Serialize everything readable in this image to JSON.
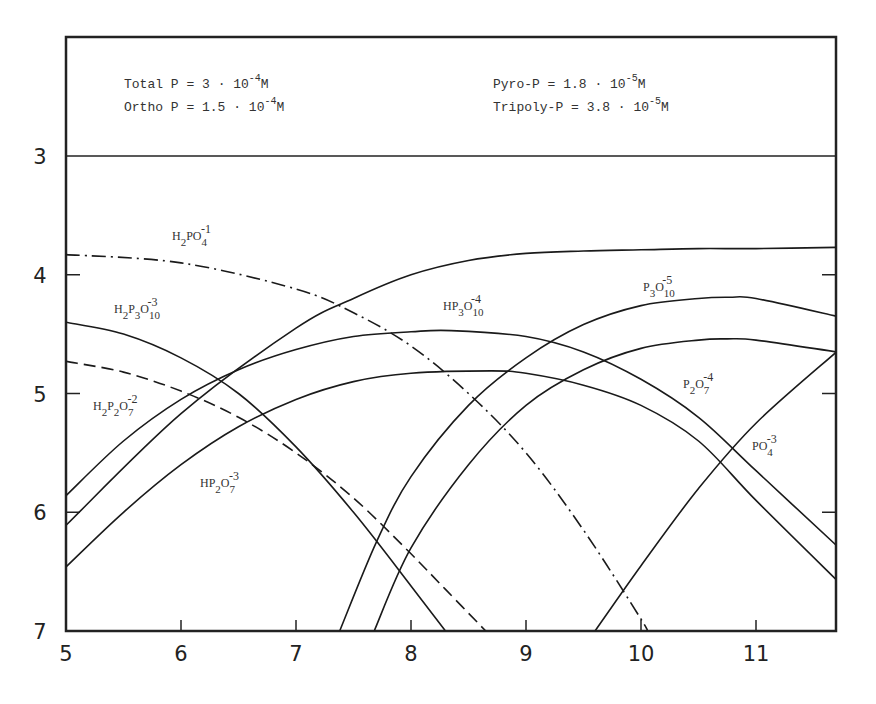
{
  "header": {
    "left": [
      {
        "label": "Total P",
        "mantissa": "3",
        "exp": "-4",
        "unit": "M"
      },
      {
        "label": "Ortho P",
        "mantissa": "1.5",
        "exp": "-4",
        "unit": "M"
      }
    ],
    "right": [
      {
        "label": "Pyro-P",
        "mantissa": "1.8",
        "exp": "-5",
        "unit": "M"
      },
      {
        "label": "Tripoly-P",
        "mantissa": "3.8",
        "exp": "-5",
        "unit": "M"
      }
    ]
  },
  "chart_data": {
    "type": "line",
    "title": "",
    "xlabel": "",
    "ylabel": "",
    "xlim": [
      5,
      11.7
    ],
    "ylim": [
      7,
      3
    ],
    "y_inverted": true,
    "grid": false,
    "x_ticks": [
      5,
      6,
      7,
      8,
      9,
      10,
      11
    ],
    "y_ticks": [
      3,
      4,
      5,
      6,
      7
    ],
    "annotations": [
      "Total P = 3 · 10^-4 M",
      "Ortho P = 1.5 · 10^-4 M",
      "Pyro-P = 1.8 · 10^-5 M",
      "Tripoly-P = 3.8 · 10^-5 M"
    ],
    "series": [
      {
        "name": "H2PO4^-1",
        "style": "dashdot",
        "x": [
          5,
          6,
          7,
          7.5,
          8,
          8.5,
          9,
          9.5,
          10,
          10.05
        ],
        "y": [
          3.83,
          3.9,
          4.12,
          4.32,
          4.6,
          5.0,
          5.5,
          6.15,
          6.9,
          7.0
        ]
      },
      {
        "name": "HPO4^-2",
        "style": "solid",
        "x": [
          5,
          6,
          7,
          7.5,
          8,
          8.5,
          9,
          9.5,
          10,
          10.5,
          11,
          11.7
        ],
        "y": [
          6.11,
          5.17,
          4.45,
          4.2,
          4.0,
          3.88,
          3.82,
          3.8,
          3.79,
          3.78,
          3.78,
          3.77
        ]
      },
      {
        "name": "PO4^-3",
        "style": "solid",
        "x": [
          9.6,
          10,
          10.5,
          11,
          11.7
        ],
        "y": [
          7.0,
          6.45,
          5.8,
          5.25,
          4.65
        ]
      },
      {
        "name": "H2P2O7^-2",
        "style": "dashed",
        "x": [
          5,
          5.5,
          6,
          6.5,
          7,
          7.5,
          8,
          8.3,
          8.65
        ],
        "y": [
          4.73,
          4.82,
          4.98,
          5.2,
          5.5,
          5.88,
          6.35,
          6.65,
          7.0
        ]
      },
      {
        "name": "HP2O7^-3",
        "style": "solid",
        "x": [
          5,
          5.5,
          6,
          6.5,
          7,
          7.5,
          8,
          8.7,
          9,
          9.5,
          10,
          10.5,
          11,
          11.7
        ],
        "y": [
          6.46,
          6.0,
          5.6,
          5.28,
          5.05,
          4.9,
          4.83,
          4.81,
          4.83,
          4.93,
          5.1,
          5.4,
          5.9,
          6.57
        ]
      },
      {
        "name": "P2O7^-4",
        "style": "solid",
        "x": [
          7.68,
          8,
          8.5,
          9,
          9.5,
          10,
          10.5,
          10.75,
          11,
          11.7
        ],
        "y": [
          7.0,
          6.3,
          5.6,
          5.1,
          4.8,
          4.62,
          4.55,
          4.54,
          4.55,
          4.65
        ]
      },
      {
        "name": "H2P3O10^-3",
        "style": "solid",
        "x": [
          5,
          5.5,
          6,
          6.5,
          7,
          7.5,
          8,
          8.3
        ],
        "y": [
          4.4,
          4.5,
          4.7,
          5.0,
          5.45,
          6.0,
          6.62,
          7.0
        ]
      },
      {
        "name": "HP3O10^-4",
        "style": "solid",
        "x": [
          5,
          5.5,
          6,
          6.5,
          7,
          7.5,
          8,
          8.35,
          9,
          9.5,
          10,
          10.5,
          11,
          11.7
        ],
        "y": [
          5.86,
          5.4,
          5.05,
          4.8,
          4.63,
          4.52,
          4.48,
          4.47,
          4.52,
          4.65,
          4.88,
          5.2,
          5.65,
          6.28
        ]
      },
      {
        "name": "P3O10^-5",
        "style": "solid",
        "x": [
          7.38,
          7.7,
          8,
          8.5,
          9,
          9.5,
          10,
          10.5,
          10.77,
          11,
          11.7
        ],
        "y": [
          7.0,
          6.25,
          5.7,
          5.1,
          4.7,
          4.42,
          4.26,
          4.2,
          4.19,
          4.2,
          4.35
        ]
      }
    ]
  },
  "labels": [
    {
      "key": "H2PO4",
      "parts": [
        [
          "H",
          ""
        ],
        [
          "2",
          "sub"
        ],
        [
          "PO",
          ""
        ],
        [
          "4",
          "sub"
        ]
      ],
      "charge": "-1",
      "px": 172,
      "py": 240
    },
    {
      "key": "H2P3O10",
      "parts": [
        [
          "H",
          ""
        ],
        [
          "2",
          "sub"
        ],
        [
          "P",
          ""
        ],
        [
          "3",
          "sub"
        ],
        [
          "O",
          ""
        ],
        [
          "10",
          "sub"
        ]
      ],
      "charge": "-3",
      "px": 114,
      "py": 313
    },
    {
      "key": "H2P2O7",
      "parts": [
        [
          "H",
          ""
        ],
        [
          "2",
          "sub"
        ],
        [
          "P",
          ""
        ],
        [
          "2",
          "sub"
        ],
        [
          "O",
          ""
        ],
        [
          "7",
          "sub"
        ]
      ],
      "charge": "-2",
      "px": 93,
      "py": 410
    },
    {
      "key": "HP2O7",
      "parts": [
        [
          "HP",
          ""
        ],
        [
          "2",
          "sub"
        ],
        [
          "O",
          ""
        ],
        [
          "7",
          "sub"
        ]
      ],
      "charge": "-3",
      "px": 200,
      "py": 487
    },
    {
      "key": "HP3O10",
      "parts": [
        [
          "HP",
          ""
        ],
        [
          "3",
          "sub"
        ],
        [
          "O",
          ""
        ],
        [
          "10",
          "sub"
        ]
      ],
      "charge": "-4",
      "px": 443,
      "py": 310
    },
    {
      "key": "P3O10",
      "parts": [
        [
          "P",
          ""
        ],
        [
          "3",
          "sub"
        ],
        [
          "O",
          ""
        ],
        [
          "10",
          "sub"
        ]
      ],
      "charge": "-5",
      "px": 643,
      "py": 291
    },
    {
      "key": "P2O7",
      "parts": [
        [
          "P",
          ""
        ],
        [
          "2",
          "sub"
        ],
        [
          "O",
          ""
        ],
        [
          "7",
          "sub"
        ]
      ],
      "charge": "-4",
      "px": 683,
      "py": 388
    },
    {
      "key": "PO4",
      "parts": [
        [
          "PO",
          ""
        ],
        [
          "4",
          "sub"
        ]
      ],
      "charge": "-3",
      "px": 752,
      "py": 450
    }
  ]
}
